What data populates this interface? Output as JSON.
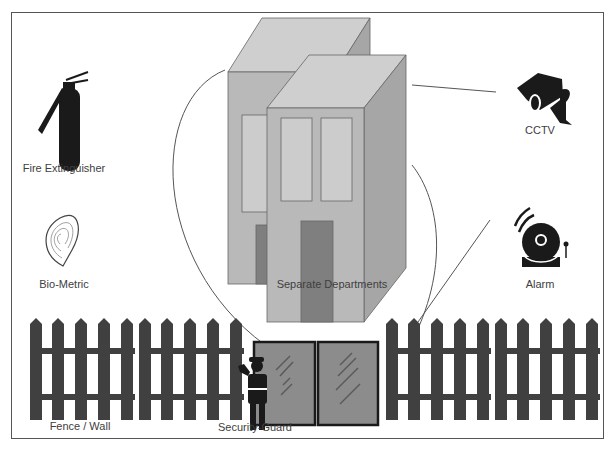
{
  "diagram": {
    "title": "",
    "center": {
      "label": "Separate Departments",
      "icon": "building-icon"
    },
    "left_items": [
      {
        "label": "Fire Extinguisher",
        "icon": "fire-extinguisher-icon"
      },
      {
        "label": "Bio-Metric",
        "icon": "fingerprint-icon"
      }
    ],
    "right_items": [
      {
        "label": "CCTV",
        "icon": "cctv-camera-icon"
      },
      {
        "label": "Alarm",
        "icon": "alarm-bell-icon"
      }
    ],
    "bottom_items": [
      {
        "label": "Fence / Wall",
        "icon": "fence-icon"
      },
      {
        "label": "Security-Guard",
        "icon": "security-guard-icon"
      }
    ],
    "colors": {
      "border": "#555555",
      "building_front": "#b9b9b9",
      "building_side": "#a6a6a6",
      "building_top": "#cfcfcf",
      "window": "#cccccc",
      "door": "#7f7f7f",
      "fence": "#404040",
      "gate": "#8c8c8c",
      "icon_dark": "#1a1a1a",
      "text": "#404040"
    }
  }
}
